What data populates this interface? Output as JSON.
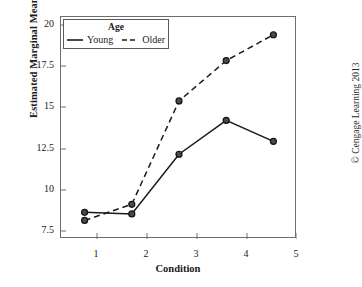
{
  "chart_data": {
    "type": "line",
    "title": "",
    "xlabel": "Condition",
    "ylabel": "Estimated Marginal Means",
    "categories": [
      "1",
      "2",
      "3",
      "4",
      "5"
    ],
    "x": [
      1,
      2,
      3,
      4,
      5
    ],
    "xlim": [
      0.5,
      5.5
    ],
    "ylim": [
      6.75,
      20.5
    ],
    "yticks": [
      7.5,
      10,
      12.5,
      15,
      17.5,
      20
    ],
    "ytick_labels": [
      "7.5",
      "10",
      "12.5",
      "15",
      "17.5",
      "20"
    ],
    "xticks": [
      1,
      2,
      3,
      4,
      5
    ],
    "xtick_labels": [
      "1",
      "2",
      "3",
      "4",
      "5"
    ],
    "grid": false,
    "legend_position": "top-left",
    "legend_title": "Age",
    "series": [
      {
        "name": "Young",
        "values": [
          8.4,
          8.3,
          12.0,
          14.1,
          12.8
        ],
        "linestyle": "solid",
        "marker": "circle",
        "color": "#1a1a1a"
      },
      {
        "name": "Older",
        "values": [
          7.9,
          8.9,
          15.3,
          17.8,
          19.4
        ],
        "linestyle": "dashed",
        "marker": "circle",
        "color": "#1a1a1a"
      }
    ]
  },
  "axes": {
    "y_title": "Estimated Marginal Means",
    "x_title": "Condition",
    "y_tick_labels": [
      "20",
      "17.5",
      "15",
      "12.5",
      "10",
      "7.5"
    ],
    "x_tick_labels": [
      "1",
      "2",
      "3",
      "4",
      "5"
    ]
  },
  "legend": {
    "title": "Age",
    "entries": [
      {
        "label": "Young",
        "style": "solid"
      },
      {
        "label": "Older",
        "style": "dashed"
      }
    ]
  },
  "footer": {
    "copyright": "© Cengage Learning 2013"
  },
  "colors": {
    "line": "#1a1a1a",
    "frame": "#6e6e6e",
    "text": "#1a1a1a"
  }
}
